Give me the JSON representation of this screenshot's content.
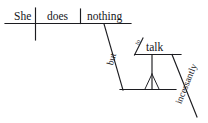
{
  "diagram": {
    "type": "reed-kellogg-sentence-diagram",
    "sentence": "She does nothing but talk incessantly.",
    "ink_color": "#1c1c20",
    "background_color": "#ffffff",
    "main_clause": {
      "subject": "She",
      "verb": "does",
      "direct_object": "nothing"
    },
    "labels": {
      "subject": "She",
      "verb": "does",
      "object": "nothing",
      "conjunction": "but",
      "infinitive_marker": "to",
      "infinitive_verb": "talk",
      "adverb": "incessantly",
      "implied_subject": ""
    },
    "slanted_words": [
      {
        "text": "but",
        "role": "conjunction"
      },
      {
        "text": "incessantly",
        "role": "adverb"
      }
    ],
    "horizontal_words": [
      {
        "text": "She",
        "role": "subject"
      },
      {
        "text": "does",
        "role": "verb"
      },
      {
        "text": "nothing",
        "role": "direct-object"
      },
      {
        "text": "talk",
        "role": "infinitive-verb"
      }
    ]
  }
}
